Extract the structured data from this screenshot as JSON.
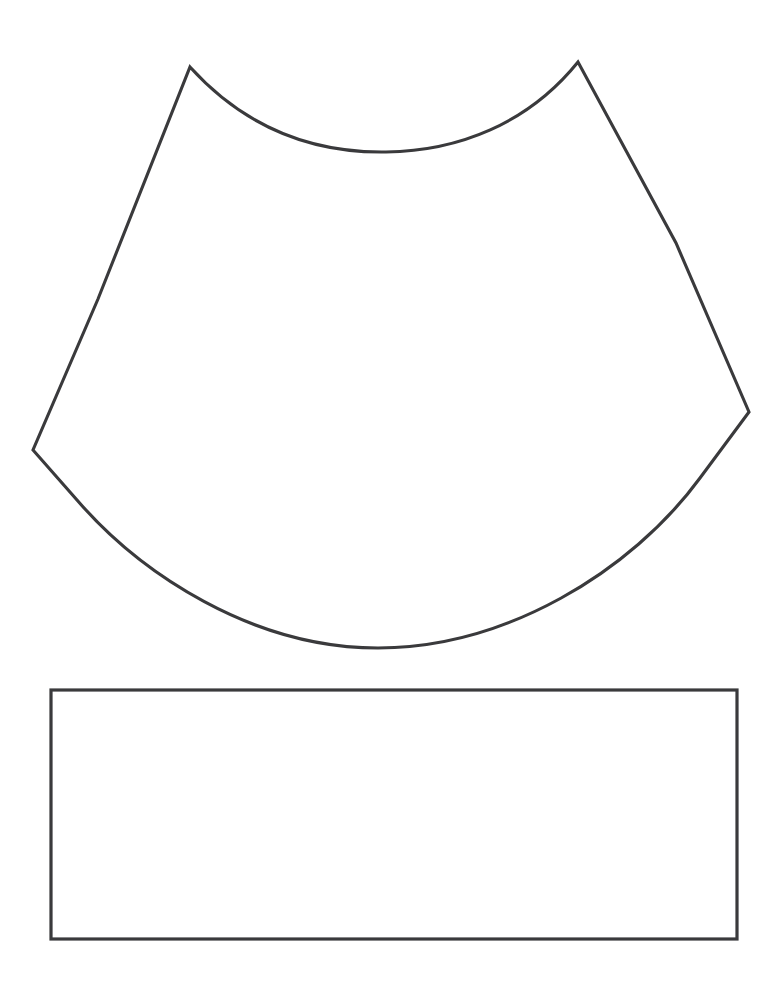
{
  "document": {
    "kind": "line-drawing",
    "title": "Pattern Template Sheet",
    "page_width": 765,
    "page_height": 993,
    "background_color": "#ffffff",
    "ink_color": "#3a3a3c",
    "scan_tint": "#fdfdfd"
  },
  "shapes": {
    "cone_gore": {
      "name": "Curved Cone Gore Pattern Piece",
      "description": "Large hand-drawn quadrilateral-like piece with a concave arc along the top edge and a convex arc along the bottom edge, joined by two slightly curved side edges meeting at left and right vertices.",
      "stroke_color": "#3a3a3c",
      "stroke_width": 3.1,
      "fill": "none",
      "vertices": {
        "top_left_peak": [
          190,
          67
        ],
        "top_right_peak": [
          578,
          62
        ],
        "left_vertex": [
          33,
          450
        ],
        "right_vertex": [
          749,
          412
        ]
      },
      "arc_extremes": {
        "top_arc_lowest_point": [
          385,
          152
        ],
        "bottom_arc_lowest_point": [
          375,
          648
        ]
      },
      "path": "M 190 67 C 248 131, 318 153, 386 152 C 458 151, 528 124, 578 62 L 676 243 L 749 412 L 700 478 C 631 572, 505 648, 378 648 C 252 648, 140 573, 77 500 L 33 450 L 98 299 Z"
    },
    "band_rectangle": {
      "name": "Rectangular Band Pattern Piece",
      "description": "Plain open rectangle drawn below the cone gore piece.",
      "stroke_color": "#3a3a3c",
      "stroke_width": 3.2,
      "fill": "none",
      "x": 51,
      "y": 690,
      "width": 686,
      "height": 249,
      "corners": {
        "top_left": [
          51,
          690
        ],
        "top_right": [
          737,
          690
        ],
        "bottom_right": [
          737,
          939
        ],
        "bottom_left": [
          51,
          939
        ]
      }
    }
  }
}
